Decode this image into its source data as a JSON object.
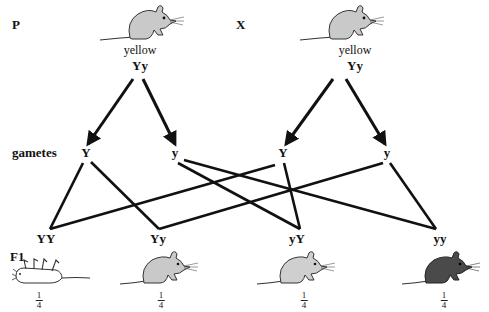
{
  "cross_symbol": "X",
  "generations": {
    "parental_label": "P",
    "gametes_label": "gametes",
    "f1_label": "F1"
  },
  "parents": [
    {
      "phenotype": "yellow",
      "genotype": "Yy",
      "coat_color": "#c9c9c9"
    },
    {
      "phenotype": "yellow",
      "genotype": "Yy",
      "coat_color": "#c9c9c9"
    }
  ],
  "gametes": [
    {
      "allele": "Y",
      "parent": 1
    },
    {
      "allele": "y",
      "parent": 1
    },
    {
      "allele": "Y",
      "parent": 2
    },
    {
      "allele": "y",
      "parent": 2
    }
  ],
  "offspring": [
    {
      "genotype": "YY",
      "fraction_num": "1",
      "fraction_den": "4",
      "state": "dead",
      "coat_color": "#ffffff"
    },
    {
      "genotype": "Yy",
      "fraction_num": "1",
      "fraction_den": "4",
      "state": "yellow",
      "coat_color": "#c9c9c9"
    },
    {
      "genotype": "yY",
      "fraction_num": "1",
      "fraction_den": "4",
      "state": "yellow",
      "coat_color": "#cfcfcf"
    },
    {
      "genotype": "yy",
      "fraction_num": "1",
      "fraction_den": "4",
      "state": "non-yellow",
      "coat_color": "#4a4a4a"
    }
  ],
  "colors": {
    "line": "#111111",
    "yellow_mouse": "#c9c9c9",
    "dark_mouse": "#4a4a4a",
    "outline": "#333333"
  }
}
